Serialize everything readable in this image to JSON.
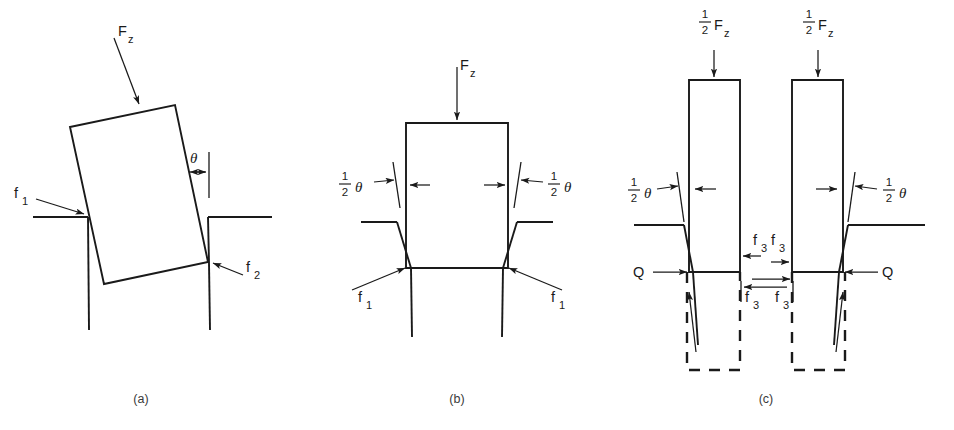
{
  "figure": {
    "type": "technical-mechanics-diagram",
    "background_color": "#ffffff",
    "line_color": "#1a1a1a",
    "panels": [
      {
        "id": "a",
        "caption": "(a)",
        "labels": {
          "applied_force": "F",
          "applied_force_sub": "z",
          "angle": "θ",
          "friction_left": "f",
          "friction_left_sub": "1",
          "friction_right": "f",
          "friction_right_sub": "2"
        }
      },
      {
        "id": "b",
        "caption": "(b)",
        "labels": {
          "applied_force": "F",
          "applied_force_sub": "z",
          "half_num": "1",
          "half_den": "2",
          "angle": "θ",
          "friction_left": "f",
          "friction_left_sub": "1",
          "friction_right": "f",
          "friction_right_sub": "1"
        }
      },
      {
        "id": "c",
        "caption": "(c)",
        "labels": {
          "applied_force": "F",
          "applied_force_sub": "z",
          "half_num": "1",
          "half_den": "2",
          "angle": "θ",
          "interface_force": "f",
          "interface_force_sub": "3",
          "reaction": "Q"
        }
      }
    ]
  }
}
